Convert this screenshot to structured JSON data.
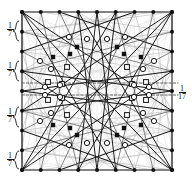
{
  "figure": {
    "canvas": {
      "width": 192,
      "height": 183
    },
    "square": {
      "left": 22,
      "top": 12,
      "right": 172,
      "bottom": 170,
      "stroke": "#6e6e6e",
      "stroke_width": 1.6
    },
    "grid": {
      "divisions": 8,
      "points_per_side": 9,
      "point_color": "#111111",
      "point_radius": 2.0
    },
    "colors": {
      "border": "#6e6e6e",
      "chord_dark": "#1a1a1a",
      "chord_mid": "#555555",
      "chord_light": "#b9b9b9",
      "chord_faint": "#d8d8d8",
      "dashed": "#3a3a3a",
      "marker_fill_open": "#ffffff",
      "marker_stroke": "#111111",
      "label_color": "#111111"
    },
    "labels": [
      {
        "id": "label-left-1",
        "numerator": "1",
        "denominator": "7",
        "x": 3,
        "y": 22,
        "side": "left"
      },
      {
        "id": "label-left-2",
        "numerator": "1",
        "denominator": "7",
        "x": 3,
        "y": 62,
        "side": "left"
      },
      {
        "id": "label-left-3",
        "numerator": "1",
        "denominator": "7",
        "x": 3,
        "y": 108,
        "side": "left"
      },
      {
        "id": "label-left-4",
        "numerator": "1",
        "denominator": "7",
        "x": 3,
        "y": 152,
        "side": "left"
      },
      {
        "id": "label-right-1",
        "numerator": "1",
        "denominator": "17",
        "x": 175,
        "y": 85,
        "side": "right"
      }
    ],
    "braces": [
      {
        "id": "brace-left-1",
        "x": 12,
        "y": 20,
        "height": 22
      },
      {
        "id": "brace-left-2",
        "x": 12,
        "y": 60,
        "height": 22
      },
      {
        "id": "brace-left-3",
        "x": 12,
        "y": 106,
        "height": 22
      },
      {
        "id": "brace-left-4",
        "x": 12,
        "y": 150,
        "height": 20
      }
    ],
    "dashed_horizontals": [
      {
        "id": "dash-h-1",
        "y": 83,
        "x1": 22,
        "x2": 178
      },
      {
        "id": "dash-h-2",
        "y": 95,
        "x1": 22,
        "x2": 178
      }
    ],
    "marker_legend": {
      "filled_circle": "lattice point on square boundary",
      "open_circle": "marked intersection of chords",
      "open_square": "marked intersection of chords (square type)",
      "filled_square": "distinguished intersection point"
    }
  }
}
